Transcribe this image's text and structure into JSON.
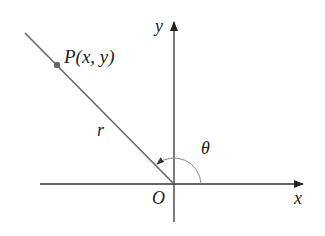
{
  "diagram": {
    "type": "polar-coordinates",
    "labels": {
      "point": "P(x, y)",
      "radius": "r",
      "angle": "θ",
      "origin": "O",
      "x_axis": "x",
      "y_axis": "y"
    },
    "colors": {
      "axes": "#333333",
      "ray": "#666666",
      "point": "#666666",
      "arc": "#888888"
    }
  }
}
